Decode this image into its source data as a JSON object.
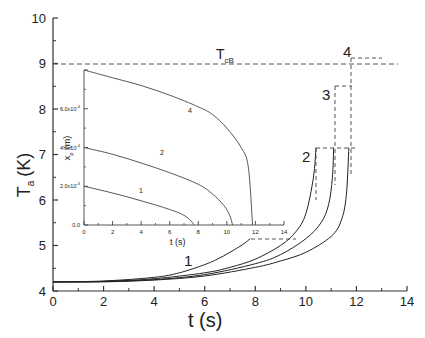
{
  "chart_data": [
    {
      "type": "line",
      "title": "",
      "xlabel": "t (s)",
      "ylabel": "T_a (K)",
      "xlim": [
        0,
        14
      ],
      "ylim": [
        4,
        10
      ],
      "xticks": [
        0,
        2,
        4,
        6,
        8,
        10,
        12,
        14
      ],
      "yticks": [
        4,
        5,
        6,
        7,
        8,
        9,
        10
      ],
      "grid": false,
      "reference_line": {
        "label": "T_cB",
        "y": 9,
        "style": "dashed"
      },
      "series": [
        {
          "name": "1",
          "x": [
            0,
            2,
            4,
            5,
            6,
            6.5,
            7,
            7.5,
            7.8
          ],
          "y": [
            4.2,
            4.22,
            4.3,
            4.4,
            4.58,
            4.7,
            4.85,
            5.02,
            5.15
          ],
          "end_marker": {
            "t": 7.8,
            "T": 5.15,
            "dash_to_t": 9.6
          }
        },
        {
          "name": "2",
          "x": [
            0,
            2,
            4,
            6,
            7,
            8,
            9,
            9.6,
            10,
            10.3,
            10.4
          ],
          "y": [
            4.2,
            4.21,
            4.27,
            4.4,
            4.52,
            4.7,
            5.0,
            5.3,
            5.7,
            6.5,
            7.15
          ],
          "end_marker": {
            "t": 10.4,
            "T": 7.15
          }
        },
        {
          "name": "3",
          "x": [
            0,
            2,
            4,
            6,
            8,
            9,
            10,
            10.6,
            10.9,
            11.05,
            11.1
          ],
          "y": [
            4.2,
            4.21,
            4.25,
            4.36,
            4.6,
            4.8,
            5.15,
            5.5,
            5.9,
            6.5,
            7.15
          ],
          "end_marker": {
            "t": 11.1,
            "T": 8.5
          }
        },
        {
          "name": "4",
          "x": [
            0,
            2,
            4,
            6,
            8,
            9,
            10,
            11,
            11.4,
            11.6,
            11.7
          ],
          "y": [
            4.2,
            4.2,
            4.24,
            4.33,
            4.52,
            4.66,
            4.85,
            5.2,
            5.55,
            6.1,
            7.15
          ],
          "end_marker": {
            "t": 11.7,
            "T": 9.1
          }
        }
      ],
      "annotations": [
        "1",
        "2",
        "3",
        "4",
        "T_cB"
      ]
    },
    {
      "type": "line",
      "inset": true,
      "xlabel": "t (s)",
      "ylabel": "x_p (m)",
      "xlim": [
        0,
        14
      ],
      "ylim": [
        0,
        0.0008
      ],
      "xticks": [
        0,
        2,
        4,
        6,
        8,
        10,
        12,
        14
      ],
      "yticks": [
        "0.0",
        "2.0x10^-4",
        "4.0x10^-4",
        "6.0x10^-4"
      ],
      "series": [
        {
          "name": "1",
          "x": [
            0,
            2,
            4,
            6,
            7,
            7.5,
            7.7
          ],
          "y": [
            0.0002,
            0.000165,
            0.000125,
            8e-05,
            5e-05,
            2e-05,
            0
          ]
        },
        {
          "name": "2",
          "x": [
            0,
            2,
            4,
            6,
            8,
            9,
            9.8,
            10.2,
            10.4
          ],
          "y": [
            0.0004,
            0.000365,
            0.00032,
            0.00027,
            0.00021,
            0.00016,
            0.0001,
            5e-05,
            0
          ]
        },
        {
          "name": "4",
          "x": [
            0,
            2,
            4,
            6,
            8,
            9,
            10,
            11,
            11.5,
            11.8
          ],
          "y": [
            0.0008,
            0.00076,
            0.00072,
            0.00067,
            0.00061,
            0.00057,
            0.0005,
            0.0004,
            0.0003,
            0
          ]
        }
      ]
    }
  ],
  "labels": {
    "main_xlabel": "t (s)",
    "main_ylabel_T": "T",
    "main_ylabel_sub": "a",
    "main_ylabel_unit": "(K)",
    "ref_T": "T",
    "ref_sub": "cB",
    "inset_xlabel": "t (s)",
    "inset_ylabel_x": "x",
    "inset_ylabel_sub": "p",
    "inset_ylabel_unit": "(m)",
    "curve1": "1",
    "curve2": "2",
    "curve3": "3",
    "curve4": "4",
    "inset_curve1": "1",
    "inset_curve2": "2",
    "inset_curve4": "4"
  },
  "ticks": {
    "main_x": [
      "0",
      "2",
      "4",
      "6",
      "8",
      "10",
      "12",
      "14"
    ],
    "main_y": [
      "4",
      "5",
      "6",
      "7",
      "8",
      "9",
      "10"
    ],
    "inset_x": [
      "0",
      "2",
      "4",
      "6",
      "8",
      "10",
      "12",
      "14"
    ],
    "inset_y": [
      "0.0",
      "2.0x10",
      "4.0x10",
      "6.0x10"
    ],
    "inset_y_exp": "-4"
  }
}
